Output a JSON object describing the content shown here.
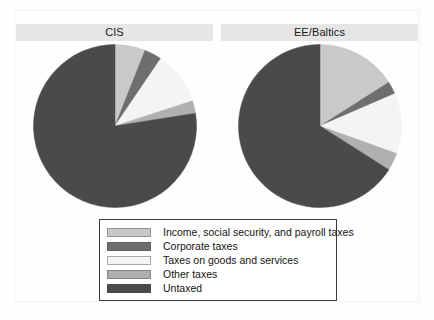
{
  "figure": {
    "background_color": "#fefefe",
    "frame_color": "#f2f2f2",
    "title_band_color": "#e6e6e6"
  },
  "legend": {
    "border_color": "#3d3d3d",
    "items": [
      {
        "label": "Income, social security, and payroll taxes",
        "color": "#c9c9c9"
      },
      {
        "label": "Corporate taxes",
        "color": "#6e6e6e"
      },
      {
        "label": "Taxes on goods and services",
        "color": "#f4f4f4"
      },
      {
        "label": "Other taxes",
        "color": "#b0b0b0"
      },
      {
        "label": "Untaxed",
        "color": "#4a4a4a"
      }
    ]
  },
  "chart_data": [
    {
      "type": "pie",
      "title": "CIS",
      "labels": [
        "Income, social security, and payroll taxes",
        "Corporate taxes",
        "Taxes on goods and services",
        "Other taxes",
        "Untaxed"
      ],
      "values": [
        6.0,
        3.5,
        10.5,
        2.5,
        77.5
      ],
      "angles_deg": [
        21.6,
        12.6,
        37.8,
        9.0,
        279.0
      ],
      "colors": [
        "#c9c9c9",
        "#6e6e6e",
        "#f4f4f4",
        "#b0b0b0",
        "#4a4a4a"
      ],
      "start_angle_deg": 0,
      "direction": "clockwise",
      "legend_position": "bottom-center"
    },
    {
      "type": "pie",
      "title": "EE/Baltics",
      "labels": [
        "Income, social security, and payroll taxes",
        "Corporate taxes",
        "Taxes on goods and services",
        "Other taxes",
        "Untaxed"
      ],
      "values": [
        16.0,
        2.5,
        12.0,
        3.5,
        66.0
      ],
      "angles_deg": [
        57.6,
        9.0,
        43.2,
        12.6,
        237.6
      ],
      "colors": [
        "#c9c9c9",
        "#6e6e6e",
        "#f4f4f4",
        "#b0b0b0",
        "#4a4a4a"
      ],
      "start_angle_deg": 0,
      "direction": "clockwise",
      "legend_position": "bottom-center"
    }
  ]
}
